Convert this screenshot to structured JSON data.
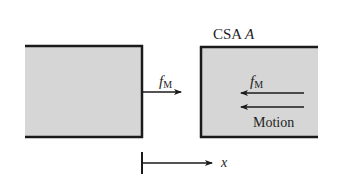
{
  "diagram": {
    "type": "free-body / control-volume sketch",
    "colors": {
      "block_fill": "#d6d6d6",
      "border": "#1a1a1a",
      "arrow": "#1a1a1a",
      "text": "#1e1e1e",
      "background": "#ffffff"
    },
    "left_block": {
      "label": ""
    },
    "right_block": {
      "label_prefix": "CSA",
      "label_var": "A"
    },
    "force_left": {
      "symbol": "f",
      "subscript": "M",
      "direction": "right"
    },
    "force_right": {
      "symbol": "f",
      "subscript": "M",
      "direction": "left"
    },
    "motion": {
      "label": "Motion",
      "direction": "left"
    },
    "axis": {
      "label": "x",
      "direction": "right"
    }
  }
}
